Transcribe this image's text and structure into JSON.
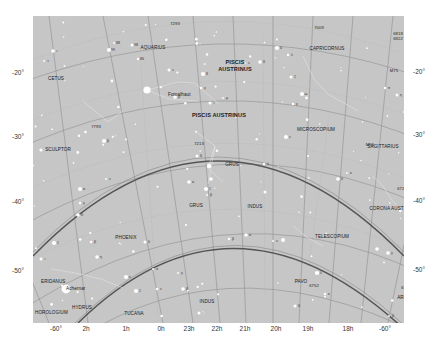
{
  "map": {
    "background": "#c6c6c6",
    "constellations": [
      {
        "name": "AQUARIUS",
        "x": 120,
        "y": 32,
        "big": false
      },
      {
        "name": "CAPRICORNUS",
        "x": 294,
        "y": 33,
        "big": false
      },
      {
        "name": "PISCIS",
        "x": 202,
        "y": 47,
        "big": true
      },
      {
        "name": "AUSTRINUS",
        "x": 202,
        "y": 54,
        "big": true
      },
      {
        "name": "CETUS",
        "x": 23,
        "y": 63,
        "big": false
      },
      {
        "name": "PISCIS AUSTRINUS",
        "x": 186,
        "y": 100,
        "big": true
      },
      {
        "name": "MICROSCOPIUM",
        "x": 283,
        "y": 114,
        "big": false
      },
      {
        "name": "SCULPTOR",
        "x": 25,
        "y": 134,
        "big": false
      },
      {
        "name": "SAGITTARIUS",
        "x": 350,
        "y": 131,
        "big": false
      },
      {
        "name": "GRUS",
        "x": 199,
        "y": 149,
        "big": false
      },
      {
        "name": "GRUS",
        "x": 163,
        "y": 190,
        "big": false
      },
      {
        "name": "INDUS",
        "x": 222,
        "y": 191,
        "big": false
      },
      {
        "name": "CORONA AUST.",
        "x": 354,
        "y": 193,
        "big": false
      },
      {
        "name": "PHOENIX",
        "x": 93,
        "y": 222,
        "big": false
      },
      {
        "name": "TELESCOPIUM",
        "x": 299,
        "y": 221,
        "big": false
      },
      {
        "name": "ERIDANUS",
        "x": 8,
        "y": 266,
        "big": false
      },
      {
        "name": "PAVO",
        "x": 268,
        "y": 266,
        "big": false
      },
      {
        "name": "INDUS",
        "x": 174,
        "y": 286,
        "big": false
      },
      {
        "name": "ARA",
        "x": 369,
        "y": 282,
        "big": false
      },
      {
        "name": "TUCANA",
        "x": 101,
        "y": 298,
        "big": false
      },
      {
        "name": "HOROLOGIUM",
        "x": 2,
        "y": 297,
        "big": false
      },
      {
        "name": "HYDRUS",
        "x": 49,
        "y": 292,
        "big": false
      }
    ],
    "named_stars": [
      {
        "name": "Fomalhaut",
        "x": 135,
        "y": 79
      },
      {
        "name": "Achernar",
        "x": 33,
        "y": 273
      }
    ],
    "catalog_labels": [
      {
        "text": "7293",
        "x": 142,
        "y": 8
      },
      {
        "text": "7009",
        "x": 286,
        "y": 12
      },
      {
        "text": "6818",
        "x": 365,
        "y": 18
      },
      {
        "text": "6822",
        "x": 365,
        "y": 23
      },
      {
        "text": "M75",
        "x": 361,
        "y": 55
      },
      {
        "text": "7793",
        "x": 63,
        "y": 111
      },
      {
        "text": "M55",
        "x": 337,
        "y": 129
      },
      {
        "text": "6723",
        "x": 369,
        "y": 173
      },
      {
        "text": "6752",
        "x": 281,
        "y": 270
      },
      {
        "text": "6723",
        "x": 373,
        "y": 272
      },
      {
        "text": "7213",
        "x": 166,
        "y": 128
      },
      {
        "text": "6541",
        "x": 396,
        "y": 252
      }
    ],
    "greek_labels": [
      {
        "t": "88",
        "x": 81,
        "y": 27
      },
      {
        "t": "98",
        "x": 99,
        "y": 29
      },
      {
        "t": "99",
        "x": 76,
        "y": 34
      },
      {
        "t": "86",
        "x": 105,
        "y": 43
      },
      {
        "t": "ι",
        "x": 20,
        "y": 35
      },
      {
        "t": "τ",
        "x": 11,
        "y": 45
      },
      {
        "t": "ε",
        "x": 136,
        "y": 54
      },
      {
        "t": "δ",
        "x": 170,
        "y": 58
      },
      {
        "t": "γ",
        "x": 168,
        "y": 72
      },
      {
        "t": "β",
        "x": 142,
        "y": 81
      },
      {
        "t": "μ",
        "x": 190,
        "y": 82
      },
      {
        "t": "ι",
        "x": 177,
        "y": 87
      },
      {
        "t": "θ",
        "x": 244,
        "y": 32
      },
      {
        "t": "λ",
        "x": 255,
        "y": 39
      },
      {
        "t": "δ",
        "x": 227,
        "y": 46
      },
      {
        "t": "ε",
        "x": 212,
        "y": 47
      },
      {
        "t": "ζ",
        "x": 258,
        "y": 61
      },
      {
        "t": "ω",
        "x": 269,
        "y": 78
      },
      {
        "t": "π",
        "x": 352,
        "y": 72
      },
      {
        "t": "ρ",
        "x": 377,
        "y": 85
      },
      {
        "t": "θ",
        "x": 371,
        "y": 96
      },
      {
        "t": "η",
        "x": 364,
        "y": 79
      },
      {
        "t": "ε",
        "x": 253,
        "y": 121
      },
      {
        "t": "γ",
        "x": 260,
        "y": 88
      },
      {
        "t": "α",
        "x": 156,
        "y": 166
      },
      {
        "t": "β",
        "x": 174,
        "y": 179
      },
      {
        "t": "δ",
        "x": 164,
        "y": 140
      },
      {
        "t": "ζ",
        "x": 173,
        "y": 173
      },
      {
        "t": "λ",
        "x": 231,
        "y": 148
      },
      {
        "t": "θ",
        "x": 305,
        "y": 163
      },
      {
        "t": "κ",
        "x": 314,
        "y": 157
      },
      {
        "t": "α",
        "x": 47,
        "y": 173
      },
      {
        "t": "β",
        "x": 71,
        "y": 125
      },
      {
        "t": "γ",
        "x": 47,
        "y": 187
      },
      {
        "t": "δ",
        "x": 45,
        "y": 199
      },
      {
        "t": "ε",
        "x": 73,
        "y": 163
      },
      {
        "t": "ι",
        "x": 8,
        "y": 243
      },
      {
        "t": "ζ",
        "x": 21,
        "y": 227
      },
      {
        "t": "β",
        "x": 58,
        "y": 226
      },
      {
        "t": "η",
        "x": 64,
        "y": 241
      },
      {
        "t": "α",
        "x": 120,
        "y": 253
      },
      {
        "t": "θ",
        "x": 112,
        "y": 226
      },
      {
        "t": "κ",
        "x": 93,
        "y": 261
      },
      {
        "t": "ε",
        "x": 124,
        "y": 273
      },
      {
        "t": "β",
        "x": 150,
        "y": 273
      },
      {
        "t": "γ",
        "x": 145,
        "y": 257
      },
      {
        "t": "ν",
        "x": 166,
        "y": 297
      },
      {
        "t": "ζ",
        "x": 103,
        "y": 275
      },
      {
        "t": "β",
        "x": 196,
        "y": 223
      },
      {
        "t": "α",
        "x": 213,
        "y": 219
      },
      {
        "t": "ε",
        "x": 240,
        "y": 225
      },
      {
        "t": "δ",
        "x": 262,
        "y": 290
      },
      {
        "t": "λ",
        "x": 284,
        "y": 257
      },
      {
        "t": "κ",
        "x": 292,
        "y": 278
      },
      {
        "t": "γ",
        "x": 355,
        "y": 237
      },
      {
        "t": "β",
        "x": 356,
        "y": 300
      },
      {
        "t": "α",
        "x": 358,
        "y": 310
      }
    ],
    "graticule": {
      "ra_lines": [
        "2h",
        "1h",
        "0h",
        "23h",
        "22h",
        "21h",
        "20h",
        "19h",
        "18h"
      ],
      "dec_lines": [
        "-20°",
        "-30°",
        "-40°",
        "-50°",
        "-60°"
      ]
    }
  },
  "axes": {
    "left_ticks": [
      {
        "label": "-20°",
        "y": 72
      },
      {
        "label": "-30°",
        "y": 136
      },
      {
        "label": "-40°",
        "y": 201
      },
      {
        "label": "-50°",
        "y": 270
      }
    ],
    "right_ticks": [
      {
        "label": "-20°",
        "y": 71
      },
      {
        "label": "-30°",
        "y": 134
      },
      {
        "label": "-40°",
        "y": 200
      },
      {
        "label": "-50°",
        "y": 269
      }
    ],
    "bottom_ticks": [
      {
        "label": "-60°",
        "x": 56
      },
      {
        "label": "2h",
        "x": 86
      },
      {
        "label": "1h",
        "x": 126
      },
      {
        "label": "0h",
        "x": 161
      },
      {
        "label": "23h",
        "x": 189
      },
      {
        "label": "22h",
        "x": 217
      },
      {
        "label": "21h",
        "x": 245
      },
      {
        "label": "20h",
        "x": 276
      },
      {
        "label": "19h",
        "x": 308
      },
      {
        "label": "18h",
        "x": 348
      },
      {
        "label": "-60°",
        "x": 385
      }
    ]
  }
}
